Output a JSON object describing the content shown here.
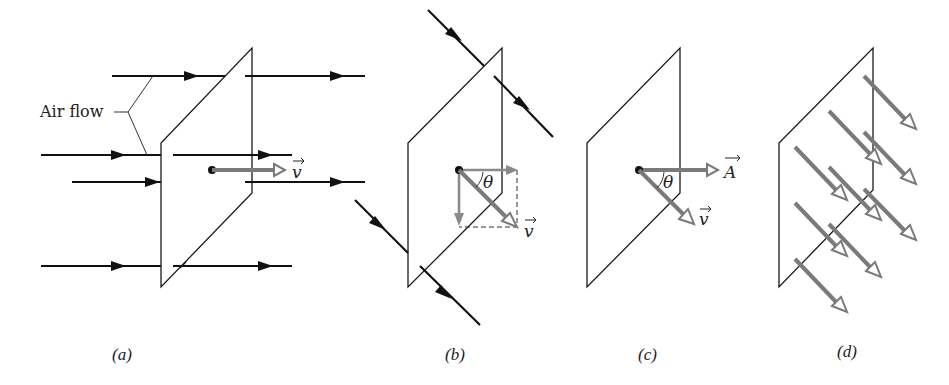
{
  "figure": {
    "panels": [
      {
        "id": "a",
        "caption": "(a)",
        "annotation": "Air flow",
        "vector_label": "v"
      },
      {
        "id": "b",
        "caption": "(b)",
        "angle_label": "θ",
        "vector_label": "v"
      },
      {
        "id": "c",
        "caption": "(c)",
        "angle_label": "θ",
        "area_vector_label": "A",
        "vector_label": "v"
      },
      {
        "id": "d",
        "caption": "(d)"
      }
    ]
  },
  "colors": {
    "line": "#111111",
    "vector_gray": "#7a7a7a",
    "background": "#ffffff"
  }
}
